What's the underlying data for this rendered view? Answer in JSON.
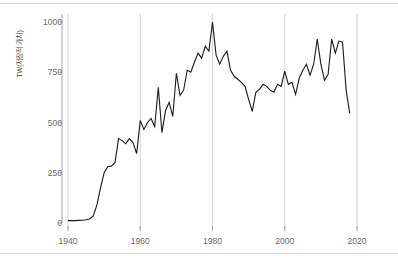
{
  "chart_data": {
    "type": "line",
    "title": "",
    "subtitle": "",
    "xlabel": "",
    "ylabel": "TW(저장적 가치)",
    "xlim": [
      1938,
      2021
    ],
    "ylim": [
      0,
      1050
    ],
    "xticks": [
      1940,
      1960,
      1980,
      2000,
      2020
    ],
    "yticks": [
      0,
      250,
      500,
      750,
      1000
    ],
    "grid": "vertical-only",
    "legend_position": "none",
    "line_color": "#1a1a1a",
    "gridline_color": "#d0d0d0",
    "axis_color": "#9a9a9a",
    "tick_label_color": "#6b6b6b",
    "x": [
      1940,
      1941,
      1942,
      1943,
      1944,
      1945,
      1946,
      1947,
      1948,
      1949,
      1950,
      1951,
      1952,
      1953,
      1954,
      1955,
      1956,
      1957,
      1958,
      1959,
      1960,
      1961,
      1962,
      1963,
      1964,
      1965,
      1966,
      1967,
      1968,
      1969,
      1970,
      1971,
      1972,
      1973,
      1974,
      1975,
      1976,
      1977,
      1978,
      1979,
      1980,
      1981,
      1982,
      1983,
      1984,
      1985,
      1986,
      1987,
      1988,
      1989,
      1990,
      1991,
      1992,
      1993,
      1994,
      1995,
      1996,
      1997,
      1998,
      1999,
      2000,
      2001,
      2002,
      2003,
      2004,
      2005,
      2006,
      2007,
      2008,
      2009,
      2010,
      2011,
      2012,
      2013,
      2014,
      2015,
      2016,
      2017,
      2018
    ],
    "values": [
      12,
      12,
      12,
      13,
      14,
      16,
      20,
      35,
      90,
      175,
      250,
      280,
      283,
      300,
      420,
      410,
      395,
      420,
      400,
      345,
      510,
      465,
      500,
      520,
      480,
      675,
      450,
      560,
      600,
      530,
      745,
      635,
      660,
      760,
      750,
      800,
      845,
      820,
      880,
      855,
      1000,
      835,
      790,
      830,
      855,
      760,
      730,
      715,
      700,
      680,
      615,
      555,
      650,
      665,
      690,
      680,
      660,
      650,
      690,
      680,
      755,
      690,
      700,
      640,
      720,
      760,
      790,
      735,
      790,
      915,
      790,
      710,
      740,
      915,
      845,
      905,
      900,
      660,
      545
    ],
    "series": [
      {
        "name": "TW(저장적 가치)",
        "values": [
          12,
          12,
          12,
          13,
          14,
          16,
          20,
          35,
          90,
          175,
          250,
          280,
          283,
          300,
          420,
          410,
          395,
          420,
          400,
          345,
          510,
          465,
          500,
          520,
          480,
          675,
          450,
          560,
          600,
          530,
          745,
          635,
          660,
          760,
          750,
          800,
          845,
          820,
          880,
          855,
          1000,
          835,
          790,
          830,
          855,
          760,
          730,
          715,
          700,
          680,
          615,
          555,
          650,
          665,
          690,
          680,
          660,
          650,
          690,
          680,
          755,
          690,
          700,
          640,
          720,
          760,
          790,
          735,
          790,
          915,
          790,
          710,
          740,
          915,
          845,
          905,
          900,
          660,
          545
        ]
      }
    ],
    "annotations": []
  }
}
